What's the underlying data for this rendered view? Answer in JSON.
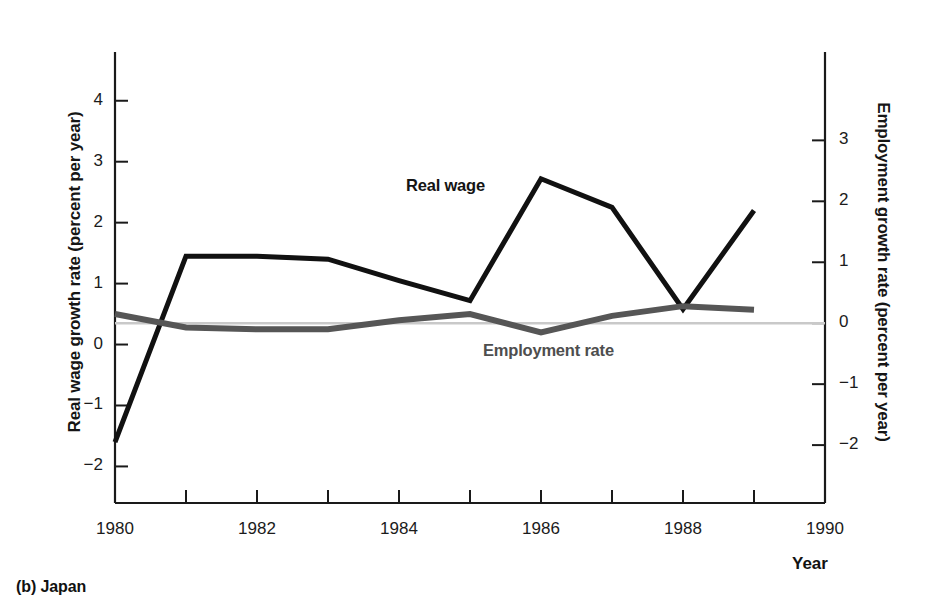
{
  "caption": "(b) Japan",
  "axes": {
    "left": {
      "title": "Real wage growth rate (percent per year)",
      "ticks": [
        4,
        3,
        2,
        1,
        0,
        -1,
        -2
      ],
      "tick_labels": [
        "4",
        "3",
        "2",
        "1",
        "0",
        "−1",
        "−2"
      ],
      "range": [
        -2.6,
        4.8
      ]
    },
    "right": {
      "title": "Employment growth rate (percent per year)",
      "ticks": [
        3,
        2,
        1,
        0,
        -1,
        -2
      ],
      "tick_labels": [
        "3",
        "2",
        "1",
        "0",
        "−1",
        "−2"
      ],
      "range": [
        -2.95,
        4.45
      ]
    },
    "x": {
      "name": "Year",
      "tick_values": [
        1980,
        1981,
        1982,
        1983,
        1984,
        1985,
        1986,
        1987,
        1988,
        1989,
        1990
      ],
      "labeled_ticks": [
        1980,
        1982,
        1984,
        1986,
        1988,
        1990
      ],
      "labels": [
        "1980",
        "1982",
        "1984",
        "1986",
        "1988",
        "1990"
      ],
      "range": [
        1980,
        1990
      ]
    }
  },
  "colors": {
    "real_wage": "#111111",
    "employment": "#565656",
    "zero_line": "#c9c9c9",
    "frame": "#1a1a1a",
    "background": "#ffffff"
  },
  "series_labels": {
    "real_wage": "Real wage",
    "employment": "Employment rate"
  },
  "chart_data": {
    "type": "line",
    "title": "(b) Japan",
    "xlabel": "Year",
    "ylabel": "Real wage growth rate (percent per year)",
    "y2label": "Employment growth rate (percent per year)",
    "x": [
      1980,
      1981,
      1982,
      1983,
      1984,
      1985,
      1986,
      1987,
      1988,
      1989
    ],
    "xlim": [
      1980,
      1990
    ],
    "ylim": [
      -2.6,
      4.8
    ],
    "y2lim": [
      -2.95,
      4.45
    ],
    "grid": false,
    "legend": "inline-annotations",
    "zero_reference_line": 0,
    "series": [
      {
        "name": "Real wage",
        "axis": "left",
        "color": "#111111",
        "width": 5,
        "values": [
          -1.6,
          1.45,
          1.45,
          1.4,
          1.05,
          0.72,
          2.72,
          2.25,
          0.58,
          2.2
        ]
      },
      {
        "name": "Employment rate",
        "axis": "right",
        "color": "#565656",
        "width": 6,
        "values": [
          0.15,
          -0.07,
          -0.1,
          -0.1,
          0.05,
          0.15,
          -0.15,
          0.12,
          0.28,
          0.22
        ]
      }
    ]
  }
}
